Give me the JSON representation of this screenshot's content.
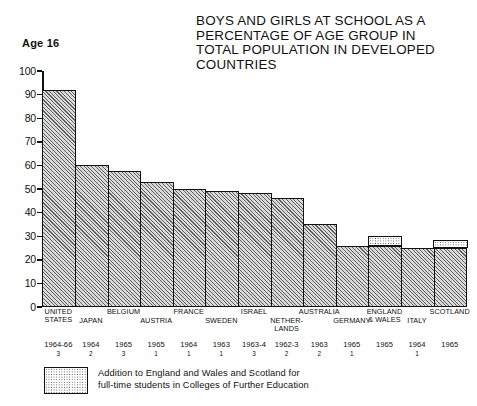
{
  "title": {
    "lines": [
      "BOYS AND GIRLS AT SCHOOL AS A",
      "PERCENTAGE OF AGE GROUP IN",
      "TOTAL POPULATION IN DEVELOPED",
      "COUNTRIES"
    ]
  },
  "age_label": "Age 16",
  "legend": {
    "swatch_name": "dotted-pattern-swatch",
    "lines": [
      "Addition to England and Wales and Scotland for",
      "full-time students in Colleges of Further Education"
    ]
  },
  "chart_data": {
    "type": "bar",
    "title": "BOYS AND GIRLS AT SCHOOL AS A PERCENTAGE OF AGE GROUP IN TOTAL POPULATION IN DEVELOPED COUNTRIES",
    "subtitle": "Age 16",
    "xlabel": "",
    "ylabel": "",
    "ylim": [
      0,
      100
    ],
    "ytick_labels": [
      "0",
      "10",
      "20",
      "30",
      "40",
      "50",
      "60",
      "70",
      "80",
      "90",
      "100"
    ],
    "ytick_values": [
      0,
      10,
      20,
      30,
      40,
      50,
      60,
      70,
      80,
      90,
      100
    ],
    "grid": false,
    "legend_position": "bottom-left",
    "categories": [
      "UNITED STATES",
      "JAPAN",
      "BELGIUM",
      "AUSTRIA",
      "FRANCE",
      "SWEDEN",
      "ISRAEL",
      "NETHER-LANDS",
      "AUSTRALIA",
      "GERMANY",
      "ENGLAND & WALES",
      "ITALY",
      "SCOTLAND"
    ],
    "series": [
      {
        "name": "Boys and girls at school as % of age group",
        "values": [
          92,
          60,
          57.5,
          53,
          50,
          49,
          48.5,
          46,
          35,
          26,
          26,
          25,
          25
        ]
      },
      {
        "name": "Addition for full-time students in Colleges of Further Education",
        "values": [
          0,
          0,
          0,
          0,
          0,
          0,
          0,
          0,
          0,
          0,
          3.5,
          0,
          3
        ]
      }
    ],
    "bars": [
      {
        "country_lines": [
          "UNITED",
          "STATES"
        ],
        "value": 92,
        "addition": 0,
        "year": "1964-66",
        "note": "3"
      },
      {
        "country_lines": [
          "JAPAN"
        ],
        "value": 60,
        "addition": 0,
        "year": "1964",
        "note": "2"
      },
      {
        "country_lines": [
          "BELGIUM"
        ],
        "value": 57.5,
        "addition": 0,
        "year": "1965",
        "note": "3"
      },
      {
        "country_lines": [
          "AUSTRIA"
        ],
        "value": 53,
        "addition": 0,
        "year": "1965",
        "note": "1"
      },
      {
        "country_lines": [
          "FRANCE"
        ],
        "value": 50,
        "addition": 0,
        "year": "1964",
        "note": "1"
      },
      {
        "country_lines": [
          "SWEDEN"
        ],
        "value": 49,
        "addition": 0,
        "year": "1963",
        "note": "1"
      },
      {
        "country_lines": [
          "ISRAEL"
        ],
        "value": 48.5,
        "addition": 0,
        "year": "1963-4",
        "note": "3"
      },
      {
        "country_lines": [
          "NETHER-",
          "LANDS"
        ],
        "value": 46,
        "addition": 0,
        "year": "1962-3",
        "note": "2"
      },
      {
        "country_lines": [
          "AUSTRALIA"
        ],
        "value": 35,
        "addition": 0,
        "year": "1963",
        "note": "2"
      },
      {
        "country_lines": [
          "GERMANY"
        ],
        "value": 26,
        "addition": 0,
        "year": "1965",
        "note": "1"
      },
      {
        "country_lines": [
          "ENGLAND",
          "& WALES"
        ],
        "value": 26,
        "addition": 3.5,
        "year": "1965",
        "note": ""
      },
      {
        "country_lines": [
          "ITALY"
        ],
        "value": 25,
        "addition": 0,
        "year": "1964",
        "note": "1"
      },
      {
        "country_lines": [
          "SCOTLAND"
        ],
        "value": 25,
        "addition": 3,
        "year": "1965",
        "note": ""
      }
    ]
  }
}
